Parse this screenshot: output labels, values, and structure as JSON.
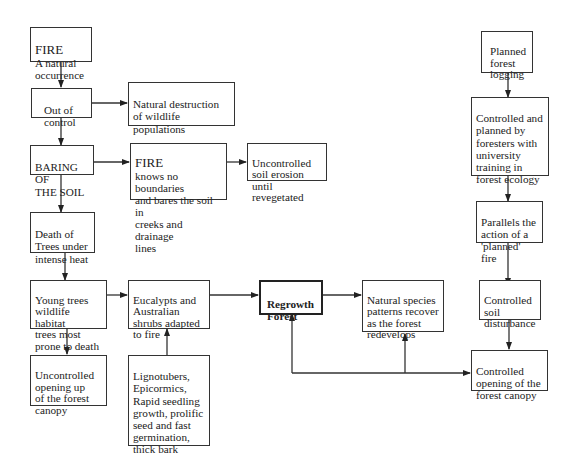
{
  "diagram": {
    "title": "",
    "nodes": {
      "fire_natural": {
        "heading": "FIRE",
        "text": "A natural\noccurrence"
      },
      "out_of_control": {
        "text": "Out of\ncontrol"
      },
      "natural_destruction": {
        "text": "Natural destruction\nof wildlife\npopulations"
      },
      "baring_soil": {
        "text": "BARING OF\nTHE SOIL"
      },
      "fire_no_boundaries": {
        "heading": "FIRE",
        "text": "knows no boundaries\nand bares the soil in\ncreeks and drainage\nlines"
      },
      "uncontrolled_erosion": {
        "text": "Uncontrolled\nsoil erosion\nuntil revegetated"
      },
      "death_of_trees": {
        "text": "Death of\nTrees under\nintense heat"
      },
      "young_trees": {
        "text": "Young trees\nwildlife habitat\ntrees most\nprone to death"
      },
      "eucalypts": {
        "text": "Eucalypts and\nAustralian\nshrubs adapted\nto fire"
      },
      "uncontrolled_opening": {
        "text": "Uncontrolled\nopening up\nof the forest\ncanopy"
      },
      "lignotubers": {
        "text": "Lignotubers,\nEpicormics,\nRapid seedling\ngrowth, prolific\nseed and fast\ngermination,\nthick bark"
      },
      "regrowth_forest": {
        "text": "Regrowth\nForest"
      },
      "natural_species": {
        "text": "Natural species\npatterns recover\nas the forest\nredevelops"
      },
      "planned_logging": {
        "text": "Planned\nforest\nlogging"
      },
      "controlled_planned": {
        "text": "Controlled and\nplanned by\nforesters with\nuniversity\ntraining in\nforest ecology"
      },
      "parallels_fire": {
        "text": "Parallels the\naction of a\n'planned' fire"
      },
      "controlled_soil": {
        "text": "Controlled\nsoil\ndisturbance"
      },
      "controlled_opening": {
        "text": "Controlled\nopening of the\nforest canopy"
      }
    },
    "edges": [
      [
        "fire_natural",
        "out_of_control"
      ],
      [
        "out_of_control",
        "natural_destruction"
      ],
      [
        "out_of_control",
        "baring_soil"
      ],
      [
        "baring_soil",
        "fire_no_boundaries"
      ],
      [
        "fire_no_boundaries",
        "uncontrolled_erosion"
      ],
      [
        "baring_soil",
        "death_of_trees"
      ],
      [
        "death_of_trees",
        "young_trees"
      ],
      [
        "young_trees",
        "eucalypts"
      ],
      [
        "young_trees",
        "uncontrolled_opening"
      ],
      [
        "lignotubers",
        "eucalypts"
      ],
      [
        "eucalypts",
        "regrowth_forest"
      ],
      [
        "regrowth_forest",
        "natural_species"
      ],
      [
        "planned_logging",
        "controlled_planned"
      ],
      [
        "controlled_planned",
        "parallels_fire"
      ],
      [
        "parallels_fire",
        "controlled_soil"
      ],
      [
        "controlled_soil",
        "controlled_opening"
      ],
      [
        "controlled_opening",
        "regrowth_forest"
      ],
      [
        "controlled_opening",
        "natural_species"
      ]
    ]
  }
}
